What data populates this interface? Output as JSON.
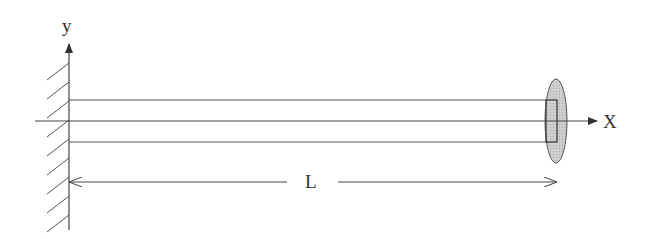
{
  "diagram": {
    "type": "cantilever-beam",
    "labels": {
      "y_axis": "y",
      "x_axis": "X",
      "length": "L"
    },
    "colors": {
      "line": "#444444",
      "ellipse_fill": "#c8c8c8",
      "background": "#ffffff"
    },
    "geometry": {
      "wall_x": 69,
      "beam_top_y": 100,
      "beam_axis_y": 121,
      "beam_bottom_y": 142,
      "beam_end_x": 557,
      "dimension_y": 182,
      "hatch_count": 10
    }
  }
}
